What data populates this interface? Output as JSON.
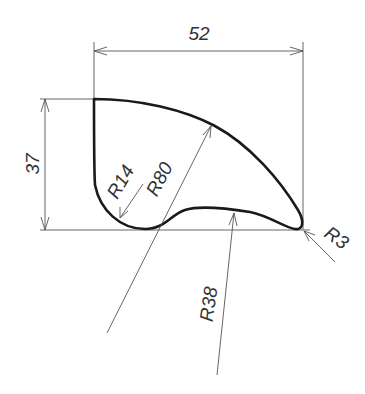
{
  "drawing": {
    "title": "Profile with arcs",
    "dimensions": {
      "width": {
        "label": "52",
        "value": 52
      },
      "height": {
        "label": "37",
        "value": 37
      },
      "radius_small_corner": {
        "label": "R14",
        "value": 14
      },
      "radius_large_arc": {
        "label": "R80",
        "value": 80
      },
      "radius_tip": {
        "label": "R3",
        "value": 3
      },
      "radius_bottom_arc": {
        "label": "R38",
        "value": 38
      }
    },
    "colors": {
      "outline": "#1a1a1a",
      "dimension_line": "#555555",
      "text": "#333333",
      "background": "#ffffff"
    }
  }
}
